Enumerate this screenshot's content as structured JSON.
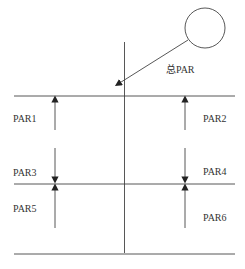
{
  "diagram": {
    "labels": {
      "total": "总PAR",
      "par1": "PAR1",
      "par2": "PAR2",
      "par3": "PAR3",
      "par4": "PAR4",
      "par5": "PAR5",
      "par6": "PAR6"
    },
    "colors": {
      "stroke": "#444444",
      "text": "#333333"
    }
  }
}
